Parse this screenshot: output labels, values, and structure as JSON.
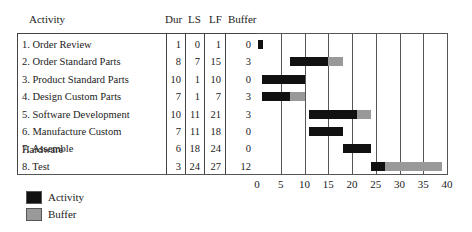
{
  "table": {
    "headers": {
      "activity": "Activity",
      "dur": "Dur",
      "ls": "LS",
      "lf": "LF",
      "buffer": "Buffer"
    },
    "rows": [
      {
        "name": "1.  Order Review",
        "dur": "1",
        "ls": "0",
        "lf": "1",
        "buffer": "0"
      },
      {
        "name": "2.  Order Standard Parts",
        "dur": "8",
        "ls": "7",
        "lf": "15",
        "buffer": "3"
      },
      {
        "name": "3.  Product Standard Parts",
        "dur": "10",
        "ls": "1",
        "lf": "10",
        "buffer": "0"
      },
      {
        "name": "4.  Design Custom Parts",
        "dur": "7",
        "ls": "1",
        "lf": "7",
        "buffer": "3"
      },
      {
        "name": "5.  Software Development",
        "dur": "10",
        "ls": "11",
        "lf": "21",
        "buffer": "3"
      },
      {
        "name": "6.  Manufacture Custom Hardware",
        "dur": "7",
        "ls": "11",
        "lf": "18",
        "buffer": "0"
      },
      {
        "name": "7.  Assemble",
        "dur": "6",
        "ls": "18",
        "lf": "24",
        "buffer": "0"
      },
      {
        "name": "8.  Test",
        "dur": "3",
        "ls": "24",
        "lf": "27",
        "buffer": "12"
      }
    ]
  },
  "axis": {
    "ticks": [
      "0",
      "5",
      "10",
      "15",
      "20",
      "25",
      "30",
      "35",
      "40"
    ]
  },
  "legend": {
    "activity": "Activity",
    "buffer": "Buffer"
  },
  "colors": {
    "activity": "#111111",
    "buffer": "#999999"
  },
  "chart_data": {
    "type": "bar",
    "subtype": "gantt",
    "title": "",
    "xlabel": "",
    "ylabel": "Activity",
    "xlim": [
      0,
      40
    ],
    "grid": true,
    "legend_position": "bottom-left",
    "categories": [
      "1. Order Review",
      "2. Order Standard Parts",
      "3. Product Standard Parts",
      "4. Design Custom Parts",
      "5. Software Development",
      "6. Manufacture Custom Hardware",
      "7. Assemble",
      "8. Test"
    ],
    "series": [
      {
        "name": "Activity",
        "start": [
          0,
          7,
          1,
          1,
          11,
          11,
          18,
          24
        ],
        "end": [
          1,
          15,
          10,
          7,
          21,
          18,
          24,
          27
        ]
      },
      {
        "name": "Buffer",
        "start": [
          1,
          15,
          10,
          7,
          21,
          18,
          24,
          27
        ],
        "end": [
          1,
          18,
          10,
          10,
          24,
          18,
          24,
          39
        ]
      }
    ],
    "columns": {
      "Dur": [
        1,
        8,
        10,
        7,
        10,
        7,
        6,
        3
      ],
      "LS": [
        0,
        7,
        1,
        1,
        11,
        11,
        18,
        24
      ],
      "LF": [
        1,
        15,
        10,
        7,
        21,
        18,
        24,
        27
      ],
      "Buffer": [
        0,
        3,
        0,
        3,
        3,
        0,
        0,
        12
      ]
    }
  }
}
